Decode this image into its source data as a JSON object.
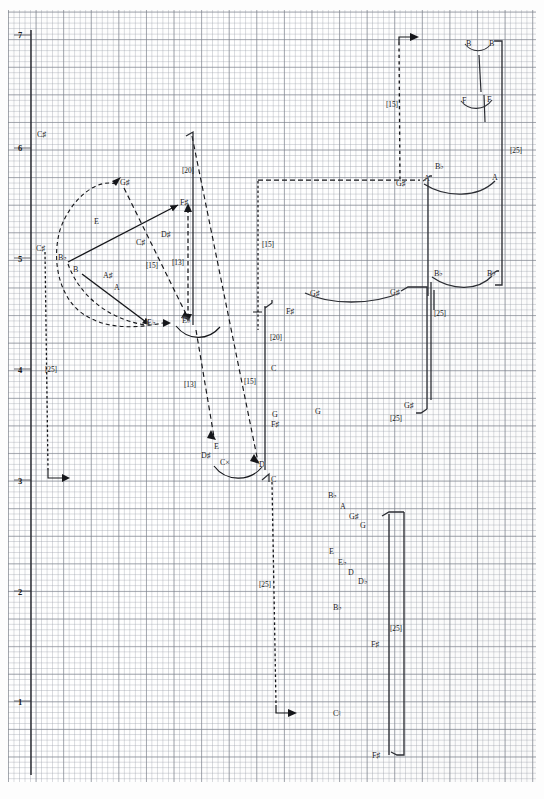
{
  "figure": {
    "kind": "hand-drawn pitch-space voice-leading graph on millimetre graph paper",
    "y_axis_name": "octave register",
    "octave_labels": [
      "7",
      "6",
      "5",
      "4",
      "3",
      "2",
      "1"
    ],
    "interval_brackets": [
      "[15]",
      "[13]",
      "[20]",
      "[25]"
    ]
  },
  "axis": {
    "ticks": [
      {
        "label": "7",
        "x": 18,
        "y": 31
      },
      {
        "label": "6",
        "x": 18,
        "y": 144
      },
      {
        "label": "5",
        "x": 18,
        "y": 255
      },
      {
        "label": "4",
        "x": 18,
        "y": 366
      },
      {
        "label": "3",
        "x": 18,
        "y": 477
      },
      {
        "label": "2",
        "x": 18,
        "y": 588
      },
      {
        "label": "1",
        "x": 18,
        "y": 698
      }
    ]
  },
  "notes": [
    {
      "id": "n01",
      "label": "C♯",
      "x": 37,
      "y": 131
    },
    {
      "id": "n02",
      "label": "G♯",
      "x": 120,
      "y": 179
    },
    {
      "id": "n03",
      "label": "F♯",
      "x": 180,
      "y": 199
    },
    {
      "id": "n04",
      "label": "E",
      "x": 94,
      "y": 218
    },
    {
      "id": "n05",
      "label": "C♯",
      "x": 36,
      "y": 245
    },
    {
      "id": "n06",
      "label": "C♯",
      "x": 136,
      "y": 239
    },
    {
      "id": "n07",
      "label": "D♯",
      "x": 161,
      "y": 231
    },
    {
      "id": "n08",
      "label": "B♭",
      "x": 58,
      "y": 254
    },
    {
      "id": "n09",
      "label": "B",
      "x": 73,
      "y": 266
    },
    {
      "id": "n10",
      "label": "A♯",
      "x": 103,
      "y": 272
    },
    {
      "id": "n11",
      "label": "A",
      "x": 114,
      "y": 284
    },
    {
      "id": "n12",
      "label": "E♭",
      "x": 147,
      "y": 319
    },
    {
      "id": "n13",
      "label": "E♭",
      "x": 182,
      "y": 317
    },
    {
      "id": "n14",
      "label": "E",
      "x": 214,
      "y": 443
    },
    {
      "id": "n15",
      "label": "D♯",
      "x": 201,
      "y": 452
    },
    {
      "id": "n16",
      "label": "C×",
      "x": 220,
      "y": 459
    },
    {
      "id": "n17",
      "label": "D",
      "x": 259,
      "y": 461
    },
    {
      "id": "n18",
      "label": "C",
      "x": 271,
      "y": 476
    },
    {
      "id": "n19",
      "label": "F♯",
      "x": 286,
      "y": 308
    },
    {
      "id": "n20",
      "label": "C",
      "x": 271,
      "y": 365
    },
    {
      "id": "n21",
      "label": "G",
      "x": 272,
      "y": 411
    },
    {
      "id": "n22",
      "label": "F♯",
      "x": 271,
      "y": 421
    },
    {
      "id": "n23",
      "label": "G",
      "x": 315,
      "y": 408
    },
    {
      "id": "n24",
      "label": "G♯",
      "x": 310,
      "y": 290
    },
    {
      "id": "n25",
      "label": "G♯",
      "x": 390,
      "y": 289
    },
    {
      "id": "n26",
      "label": "G♯",
      "x": 404,
      "y": 402
    },
    {
      "id": "n27",
      "label": "G♯",
      "x": 396,
      "y": 180
    },
    {
      "id": "n28",
      "label": "A",
      "x": 424,
      "y": 175
    },
    {
      "id": "n29",
      "label": "B♭",
      "x": 435,
      "y": 163
    },
    {
      "id": "n30",
      "label": "A",
      "x": 492,
      "y": 174
    },
    {
      "id": "n31",
      "label": "B♭",
      "x": 434,
      "y": 270
    },
    {
      "id": "n32",
      "label": "B♭",
      "x": 487,
      "y": 270
    },
    {
      "id": "n33",
      "label": "B",
      "x": 466,
      "y": 40
    },
    {
      "id": "n34",
      "label": "B",
      "x": 489,
      "y": 40
    },
    {
      "id": "n35",
      "label": "F",
      "x": 462,
      "y": 97
    },
    {
      "id": "n36",
      "label": "F",
      "x": 487,
      "y": 96
    },
    {
      "id": "n37",
      "label": "B♭",
      "x": 328,
      "y": 492
    },
    {
      "id": "n38",
      "label": "A",
      "x": 340,
      "y": 503
    },
    {
      "id": "n39",
      "label": "G♯",
      "x": 349,
      "y": 513
    },
    {
      "id": "n40",
      "label": "G",
      "x": 360,
      "y": 522
    },
    {
      "id": "n41",
      "label": "E",
      "x": 329,
      "y": 548
    },
    {
      "id": "n42",
      "label": "E♭",
      "x": 338,
      "y": 559
    },
    {
      "id": "n43",
      "label": "D",
      "x": 348,
      "y": 569
    },
    {
      "id": "n44",
      "label": "D♭",
      "x": 358,
      "y": 578
    },
    {
      "id": "n45",
      "label": "B♭",
      "x": 333,
      "y": 604
    },
    {
      "id": "n46",
      "label": "F♯",
      "x": 371,
      "y": 641
    },
    {
      "id": "n47",
      "label": "C♮",
      "x": 333,
      "y": 710
    },
    {
      "id": "n48",
      "label": "F♯",
      "x": 372,
      "y": 752
    }
  ],
  "brackets": [
    {
      "id": "b01",
      "label": "[20]",
      "x": 182,
      "y": 167
    },
    {
      "id": "b02",
      "label": "[15]",
      "x": 146,
      "y": 262
    },
    {
      "id": "b03",
      "label": "[13]",
      "x": 172,
      "y": 259
    },
    {
      "id": "b04",
      "label": "[25]",
      "x": 45,
      "y": 366
    },
    {
      "id": "b05",
      "label": "[13]",
      "x": 184,
      "y": 381
    },
    {
      "id": "b06",
      "label": "[15]",
      "x": 244,
      "y": 378
    },
    {
      "id": "b07",
      "label": "[15]",
      "x": 262,
      "y": 241
    },
    {
      "id": "b08",
      "label": "[20]",
      "x": 270,
      "y": 334
    },
    {
      "id": "b09",
      "label": "[15]",
      "x": 386,
      "y": 101
    },
    {
      "id": "b10",
      "label": "[25]",
      "x": 510,
      "y": 147
    },
    {
      "id": "b11",
      "label": "[25]",
      "x": 434,
      "y": 310
    },
    {
      "id": "b12",
      "label": "[25]",
      "x": 390,
      "y": 415
    },
    {
      "id": "b13",
      "label": "[25]",
      "x": 259,
      "y": 581
    },
    {
      "id": "b14",
      "label": "[25]",
      "x": 390,
      "y": 625
    }
  ]
}
